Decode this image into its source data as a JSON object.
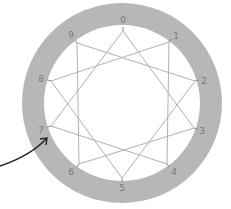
{
  "diagram": {
    "type": "star-polygon",
    "notation": "{10/3}",
    "ring": {
      "center": [
        122,
        103
      ],
      "outer_radius": 100,
      "inner_radius": 78,
      "ring_color": "#b7b7b7",
      "inner_color": "#ffffff"
    },
    "line_color": "#b0b0b0",
    "label_color": "#7a7a7a",
    "points": [
      {
        "label": "0",
        "vertex": [
          123,
          31
        ],
        "label_pos": [
          123,
          20
        ]
      },
      {
        "label": "1",
        "vertex": [
          169,
          42
        ],
        "label_pos": [
          176,
          36
        ]
      },
      {
        "label": "2",
        "vertex": [
          195,
          81
        ],
        "label_pos": [
          204,
          81
        ]
      },
      {
        "label": "3",
        "vertex": [
          194,
          128
        ],
        "label_pos": [
          202,
          131
        ]
      },
      {
        "label": "4",
        "vertex": [
          167,
          164
        ],
        "label_pos": [
          174,
          172
        ]
      },
      {
        "label": "5",
        "vertex": [
          122,
          178
        ],
        "label_pos": [
          122,
          188
        ]
      },
      {
        "label": "6",
        "vertex": [
          79,
          164
        ],
        "label_pos": [
          71,
          172
        ]
      },
      {
        "label": "7",
        "vertex": [
          51,
          126
        ],
        "label_pos": [
          41,
          130
        ]
      },
      {
        "label": "8",
        "vertex": [
          51,
          81
        ],
        "label_pos": [
          41,
          79
        ]
      },
      {
        "label": "9",
        "vertex": [
          77,
          43
        ],
        "label_pos": [
          71,
          35
        ]
      }
    ],
    "edges": [
      [
        0,
        3
      ],
      [
        3,
        6
      ],
      [
        6,
        9
      ],
      [
        9,
        2
      ],
      [
        2,
        5
      ],
      [
        5,
        8
      ],
      [
        8,
        1
      ],
      [
        1,
        4
      ],
      [
        4,
        7
      ],
      [
        7,
        0
      ]
    ],
    "arrow": {
      "color": "#222222",
      "path": "M 0 166 C 18 160, 36 150, 47 138",
      "head": [
        47,
        138
      ]
    }
  }
}
